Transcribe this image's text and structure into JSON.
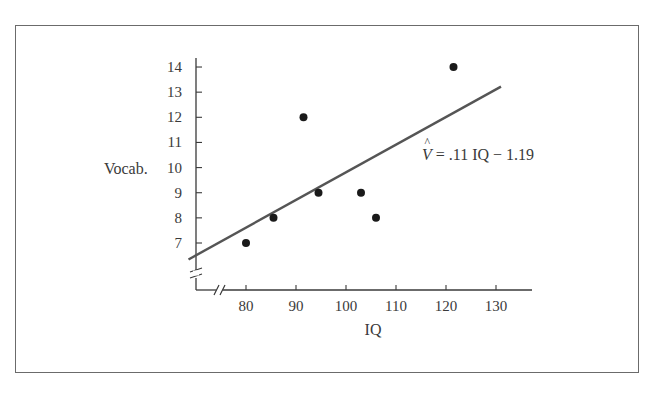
{
  "chart_data": {
    "type": "scatter",
    "title": "",
    "xlabel": "IQ",
    "ylabel": "Vocab.",
    "x_ticks": [
      80,
      90,
      100,
      110,
      120,
      130
    ],
    "y_ticks": [
      7,
      8,
      9,
      10,
      11,
      12,
      13,
      14
    ],
    "xlim": [
      70,
      137
    ],
    "ylim": [
      5.5,
      14.5
    ],
    "axis_breaks": {
      "x": true,
      "y": true
    },
    "grid": false,
    "legend": null,
    "series": [
      {
        "name": "observations",
        "points": [
          {
            "x": 80,
            "y": 7
          },
          {
            "x": 85.5,
            "y": 8
          },
          {
            "x": 91.5,
            "y": 12
          },
          {
            "x": 94.5,
            "y": 9
          },
          {
            "x": 103,
            "y": 9
          },
          {
            "x": 106,
            "y": 8
          },
          {
            "x": 121.5,
            "y": 14
          }
        ]
      }
    ],
    "regression_line": {
      "label": "V̂ = .11 IQ − 1.19",
      "slope": 0.11,
      "intercept": -1.19,
      "x_range": [
        68.5,
        131
      ]
    },
    "annotations": [
      {
        "text": "V̂ = .11 IQ − 1.19",
        "x": 111,
        "y": 10.9
      }
    ]
  },
  "labels": {
    "x_axis": "IQ",
    "y_axis": "Vocab.",
    "equation_hat": "V",
    "equation_rest": " = .11 IQ − 1.19"
  }
}
